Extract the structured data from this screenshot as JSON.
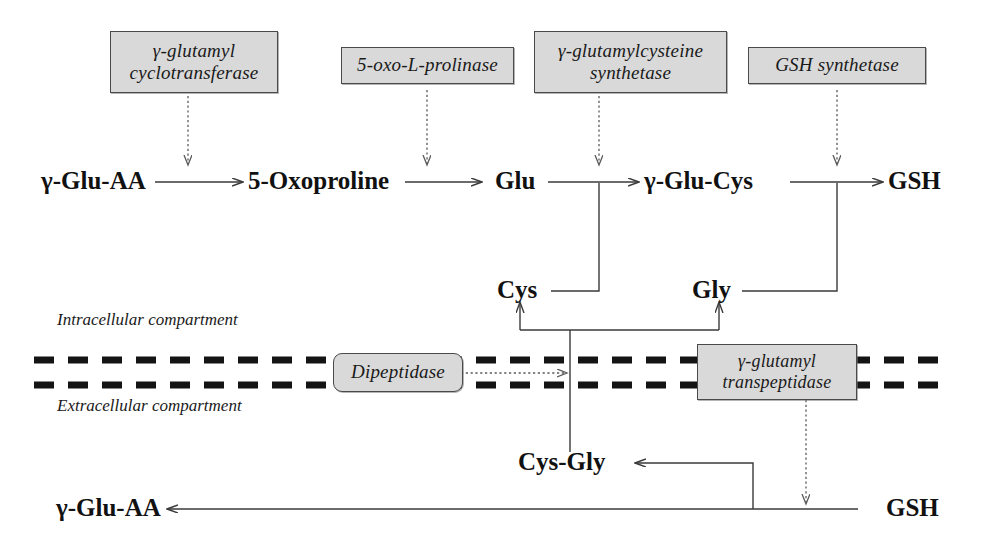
{
  "diagram": {
    "colors": {
      "enzyme_box_fill": "#d9d9d9",
      "enzyme_box_border": "#4a4a4a",
      "line": "#3a3a3a",
      "membrane": "#141414",
      "text": "#111111",
      "background": "#ffffff"
    },
    "enzymes": [
      {
        "id": "gamma-glutamyl-cyclotransferase",
        "line1": "γ-glutamyl",
        "line2": "cyclotransferase",
        "shape": "rectangle"
      },
      {
        "id": "5-oxo-l-prolinase",
        "line1": "5-oxo-L-prolinase",
        "line2": "",
        "shape": "rectangle"
      },
      {
        "id": "gamma-glutamylcysteine-synthetase",
        "line1": "γ-glutamylcysteine",
        "line2": "synthetase",
        "shape": "rectangle"
      },
      {
        "id": "gsh-synthetase",
        "line1": "GSH synthetase",
        "line2": "",
        "shape": "rectangle"
      },
      {
        "id": "dipeptidase",
        "line1": "Dipeptidase",
        "line2": "",
        "shape": "rounded"
      },
      {
        "id": "gamma-glutamyl-transpeptidase",
        "line1": "γ-glutamyl",
        "line2": "transpeptidase",
        "shape": "rectangle"
      }
    ],
    "metabolites": {
      "gamma_glu_aa_top": "γ-Glu-AA",
      "oxoproline": "5-Oxoproline",
      "glu": "Glu",
      "gamma_glu_cys": "γ-Glu-Cys",
      "gsh_top": "GSH",
      "cys": "Cys",
      "gly": "Gly",
      "cys_gly": "Cys-Gly",
      "gamma_glu_aa_bottom": "γ-Glu-AA",
      "gsh_bottom": "GSH"
    },
    "compartments": {
      "intracellular": "Intracellular compartment",
      "extracellular": "Extracellular compartment"
    }
  }
}
